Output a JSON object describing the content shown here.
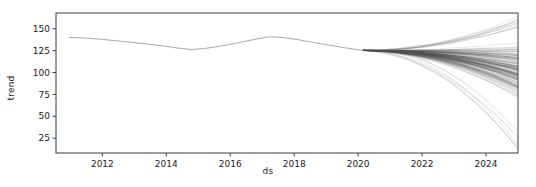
{
  "chart_data": {
    "type": "line",
    "title": "",
    "xlabel": "ds",
    "ylabel": "trend",
    "xlim": [
      2010.55,
      2025.0
    ],
    "ylim": [
      8,
      168
    ],
    "xticks": [
      2012,
      2014,
      2016,
      2018,
      2020,
      2022,
      2024
    ],
    "xtick_labels": [
      "2012",
      "2014",
      "2016",
      "2018",
      "2020",
      "2022",
      "2024"
    ],
    "yticks": [
      25,
      50,
      75,
      100,
      125,
      150
    ],
    "ytick_labels": [
      "25",
      "50",
      "75",
      "100",
      "125",
      "150"
    ],
    "grid": false,
    "legend": null,
    "legend_position": "none",
    "series": [
      {
        "name": "historical trend",
        "color": "#a8a8a8",
        "linewidth": 1.0,
        "x": [
          2010.95,
          2011.4,
          2011.9,
          2012.4,
          2012.9,
          2013.4,
          2013.9,
          2014.3,
          2014.8,
          2015.2,
          2015.7,
          2016.2,
          2016.7,
          2017.2,
          2017.6,
          2018.1,
          2018.6,
          2019.1,
          2019.6,
          2020.1
        ],
        "y": [
          140.0,
          139.4,
          138.2,
          136.4,
          134.6,
          132.6,
          130.4,
          128.2,
          126.2,
          127.4,
          130.2,
          133.6,
          137.4,
          140.8,
          140.2,
          137.6,
          134.4,
          131.2,
          128.2,
          125.4
        ]
      }
    ],
    "forecast_fan": {
      "description": "posterior sample trajectories of trend after 2020",
      "color": "#4d4d4d",
      "alpha": 0.18,
      "n_samples": 180,
      "split_x": 2020.15,
      "split_y": 125.2,
      "end_x": 2025.0,
      "end_y_min": 12,
      "end_y_max": 165,
      "end_y_dense_low": 38,
      "end_y_dense_high": 150,
      "end_y_mode": 116,
      "seed": 20240117
    }
  },
  "figure": {
    "background": "#ffffff",
    "axes_color": "#3c3c3c",
    "text_color": "#1a1a1a",
    "plot_left": 56,
    "plot_right": 518,
    "plot_top": 13,
    "plot_bottom": 153
  }
}
